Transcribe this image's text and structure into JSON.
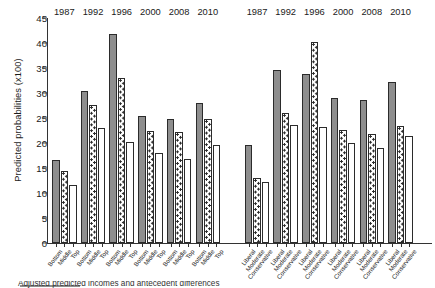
{
  "figure": {
    "ylabel": "Predicted probabilities (x100)",
    "caption_fragment": "Adjusted predicted incomes and antecedent differences"
  },
  "axis": {
    "yticks": [
      "0",
      "5",
      "10",
      "15",
      "20",
      "25",
      "30",
      "35",
      "40",
      "45"
    ],
    "ymin": 0,
    "ymax": 45
  },
  "panels": [
    {
      "name": "income",
      "categories": [
        "Bottom",
        "Middle",
        "Top"
      ],
      "years": [
        "1987",
        "1992",
        "1996",
        "2000",
        "2008",
        "2010"
      ]
    },
    {
      "name": "ideology",
      "categories": [
        "Liberal",
        "Moderate",
        "Conservative"
      ],
      "years": [
        "1987",
        "1992",
        "1996",
        "2000",
        "2008",
        "2010"
      ]
    }
  ],
  "chart_data": {
    "type": "bar",
    "title": "",
    "xlabel": "",
    "ylabel": "Predicted probabilities (x100)",
    "ylim": [
      0,
      45
    ],
    "ytick_step": 5,
    "grid": false,
    "legend": [
      "Bottom / Liberal",
      "Middle / Moderate",
      "Top / Conservative"
    ],
    "legend_position": "none",
    "groups": [
      {
        "panel": "income",
        "year": "1987",
        "categories": [
          "Bottom",
          "Middle",
          "Top"
        ],
        "values": [
          16.7,
          14.5,
          11.6
        ]
      },
      {
        "panel": "income",
        "year": "1992",
        "categories": [
          "Bottom",
          "Middle",
          "Top"
        ],
        "values": [
          30.4,
          27.7,
          23.0
        ]
      },
      {
        "panel": "income",
        "year": "1996",
        "categories": [
          "Bottom",
          "Middle",
          "Top"
        ],
        "values": [
          41.9,
          33.0,
          20.2
        ]
      },
      {
        "panel": "income",
        "year": "2000",
        "categories": [
          "Bottom",
          "Middle",
          "Top"
        ],
        "values": [
          25.4,
          22.5,
          18.0
        ]
      },
      {
        "panel": "income",
        "year": "2008",
        "categories": [
          "Bottom",
          "Middle",
          "Top"
        ],
        "values": [
          24.9,
          22.2,
          16.8
        ]
      },
      {
        "panel": "income",
        "year": "2010",
        "categories": [
          "Bottom",
          "Middle",
          "Top"
        ],
        "values": [
          28.1,
          24.8,
          19.7
        ]
      },
      {
        "panel": "ideology",
        "year": "1987",
        "categories": [
          "Liberal",
          "Moderate",
          "Conservative"
        ],
        "values": [
          19.6,
          13.0,
          12.2
        ]
      },
      {
        "panel": "ideology",
        "year": "1992",
        "categories": [
          "Liberal",
          "Moderate",
          "Conservative"
        ],
        "values": [
          34.7,
          26.0,
          23.6
        ]
      },
      {
        "panel": "ideology",
        "year": "1996",
        "categories": [
          "Liberal",
          "Moderate",
          "Conservative"
        ],
        "values": [
          33.8,
          40.2,
          23.2
        ]
      },
      {
        "panel": "ideology",
        "year": "2000",
        "categories": [
          "Liberal",
          "Moderate",
          "Conservative"
        ],
        "values": [
          29.1,
          22.6,
          20.0
        ]
      },
      {
        "panel": "ideology",
        "year": "2008",
        "categories": [
          "Liberal",
          "Moderate",
          "Conservative"
        ],
        "values": [
          28.7,
          21.8,
          19.0
        ]
      },
      {
        "panel": "ideology",
        "year": "2010",
        "categories": [
          "Liberal",
          "Moderate",
          "Conservative"
        ],
        "values": [
          32.3,
          23.4,
          21.4
        ]
      }
    ]
  }
}
